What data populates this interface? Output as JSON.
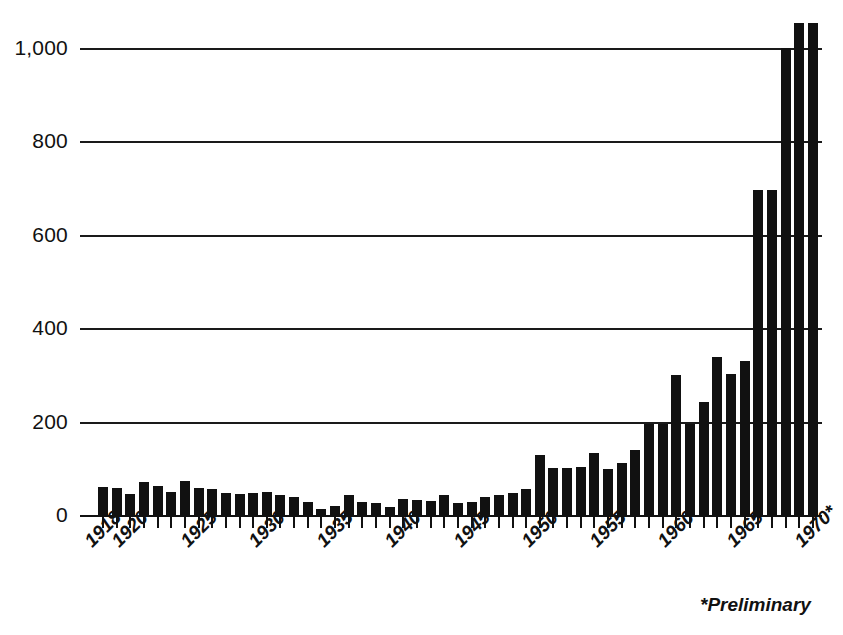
{
  "chart_data": {
    "type": "bar",
    "title": "",
    "subtitle": "",
    "xlabel": "",
    "ylabel": "",
    "grid": true,
    "legend": null,
    "xlim": [
      1918,
      1970
    ],
    "ylim": [
      0,
      1100
    ],
    "y_ticks": [
      0,
      200,
      400,
      600,
      800,
      1000
    ],
    "y_tick_labels": [
      "0",
      "200",
      "400",
      "600",
      "800",
      "1,000"
    ],
    "x_tick_labels": [
      "1918",
      "1920",
      "1925",
      "1930",
      "1935",
      "1940",
      "1945",
      "1950",
      "1955",
      "1960",
      "1965",
      "1970*"
    ],
    "x_tick_years": [
      1918,
      1920,
      1925,
      1930,
      1935,
      1940,
      1945,
      1950,
      1955,
      1960,
      1965,
      1970
    ],
    "annotations": [
      "*Preliminary"
    ],
    "bar_color": "#111111",
    "categories": [
      1918,
      1919,
      1920,
      1921,
      1922,
      1923,
      1924,
      1925,
      1926,
      1927,
      1928,
      1929,
      1930,
      1931,
      1932,
      1933,
      1934,
      1935,
      1936,
      1937,
      1938,
      1939,
      1940,
      1941,
      1942,
      1943,
      1944,
      1945,
      1946,
      1947,
      1948,
      1949,
      1950,
      1951,
      1952,
      1953,
      1954,
      1955,
      1956,
      1957,
      1958,
      1959,
      1960,
      1961,
      1962,
      1963,
      1964,
      1965,
      1966,
      1967,
      1968,
      1969,
      1970
    ],
    "values": [
      60,
      58,
      45,
      70,
      62,
      50,
      72,
      58,
      55,
      48,
      45,
      48,
      50,
      42,
      38,
      28,
      12,
      20,
      42,
      28,
      25,
      18,
      35,
      32,
      30,
      42,
      26,
      28,
      38,
      42,
      48,
      55,
      128,
      100,
      100,
      102,
      132,
      98,
      112,
      140,
      195,
      195,
      300,
      195,
      243,
      338,
      302,
      330,
      697,
      695,
      1000,
      1053,
      1053
    ]
  },
  "footnote": {
    "text": "*Preliminary"
  }
}
